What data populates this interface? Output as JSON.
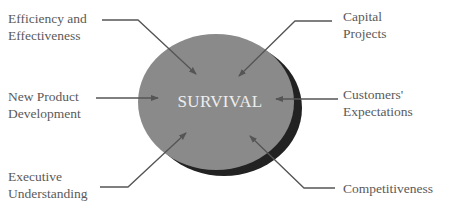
{
  "diagram": {
    "center_label": "SURVIVAL",
    "colors": {
      "ellipse": "#8a8a8a",
      "shadow": "#222222",
      "arrows": "#555555",
      "text": "#5a5a5a"
    },
    "factors": [
      {
        "line1": "Efficiency and",
        "line2": "Effectiveness",
        "position": "top-left"
      },
      {
        "line1": "Capital",
        "line2": "Projects",
        "position": "top-right"
      },
      {
        "line1": "New Product",
        "line2": "Development",
        "position": "middle-left"
      },
      {
        "line1": "Customers'",
        "line2": "Expectations",
        "position": "middle-right"
      },
      {
        "line1": "Executive",
        "line2": "Understanding",
        "position": "bottom-left"
      },
      {
        "line1": "Competitiveness",
        "line2": "",
        "position": "bottom-right"
      }
    ]
  }
}
